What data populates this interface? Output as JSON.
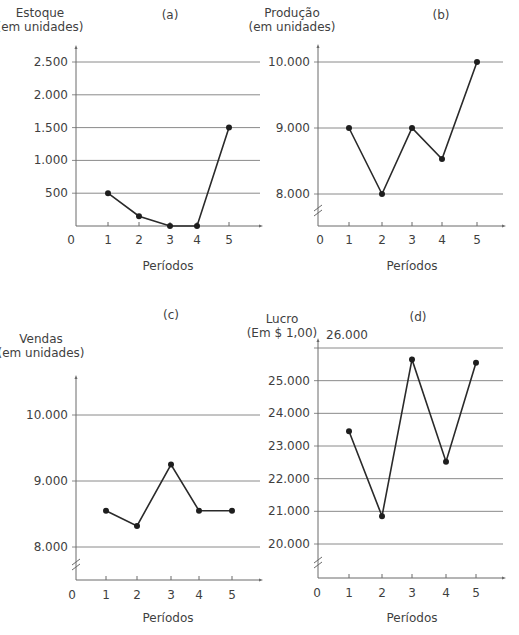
{
  "chart_data": [
    {
      "id": "a",
      "type": "line",
      "panel_label": "(a)",
      "title": "",
      "ylabel": [
        "Estoque",
        "(em unidades)"
      ],
      "xlabel": "Períodos",
      "x_origin_label": "0",
      "categories": [
        "1",
        "2",
        "3",
        "4",
        "5"
      ],
      "values": [
        500,
        150,
        0,
        0,
        1500
      ],
      "y_ticks": [
        500,
        1000,
        1500,
        2000,
        2500
      ],
      "y_tick_labels": [
        "500",
        "1.000",
        "1.500",
        "2.000",
        "2.500"
      ],
      "ylim": [
        0,
        2750
      ],
      "axis_break": false,
      "grid": true,
      "legend": null
    },
    {
      "id": "b",
      "type": "line",
      "panel_label": "(b)",
      "title": "",
      "ylabel": [
        "Produção",
        "(em unidades)"
      ],
      "xlabel": "Períodos",
      "x_origin_label": "0",
      "categories": [
        "1",
        "2",
        "3",
        "4",
        "5"
      ],
      "values": [
        9000,
        8000,
        9000,
        8530,
        10000
      ],
      "y_ticks": [
        8000,
        9000,
        10000
      ],
      "y_tick_labels": [
        "8.000",
        "9.000",
        "10.000"
      ],
      "ylim": [
        7500,
        10250
      ],
      "axis_break": true,
      "grid": true,
      "legend": null
    },
    {
      "id": "c",
      "type": "line",
      "panel_label": "(c)",
      "title": "",
      "ylabel": [
        "Vendas",
        "(em unidades)"
      ],
      "xlabel": "Períodos",
      "x_origin_label": "0",
      "categories": [
        "1",
        "2",
        "3",
        "4",
        "5"
      ],
      "values": [
        8550,
        8320,
        9250,
        8550,
        8550
      ],
      "y_ticks": [
        8000,
        9000,
        10000
      ],
      "y_tick_labels": [
        "8.000",
        "9.000",
        "10.000"
      ],
      "ylim": [
        7500,
        10600
      ],
      "axis_break": true,
      "grid": true,
      "legend": null
    },
    {
      "id": "d",
      "type": "line",
      "panel_label": "(d)",
      "title": "",
      "ylabel": [
        "Lucro",
        "(Em $ 1,00)"
      ],
      "xlabel": "Períodos",
      "x_origin_label": "0",
      "categories": [
        "1",
        "2",
        "3",
        "4",
        "5"
      ],
      "values": [
        23450,
        20850,
        25650,
        22520,
        25550
      ],
      "y_ticks": [
        20000,
        21000,
        22000,
        23000,
        24000,
        25000,
        26000
      ],
      "y_tick_labels": [
        "20.000",
        "21.000",
        "22.000",
        "23.000",
        "24.000",
        "25.000",
        "26.000"
      ],
      "ylim": [
        19000,
        26300
      ],
      "axis_break": true,
      "grid": true,
      "legend": null
    }
  ],
  "colors": {
    "line": "#2a2a2a",
    "marker": "#1e1e1e",
    "grid": "#8a8a8a",
    "axis": "#6a6a6a",
    "text": "#3f3f3f"
  }
}
